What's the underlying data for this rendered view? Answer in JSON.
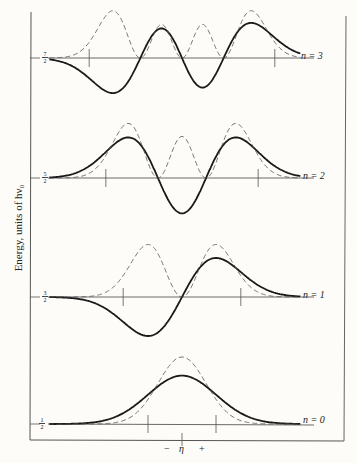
{
  "chart_data": {
    "type": "line",
    "title": "",
    "ylabel": "Energy, units of hν₀",
    "xlabel": "η",
    "x_axis_marks": [
      "−",
      "η",
      "+"
    ],
    "levels": [
      {
        "n": 0,
        "label": "n = 0",
        "energy": "1/2",
        "energy_num": 0.5,
        "turning_points": [
          -1.0,
          1.0
        ],
        "nodes": 0
      },
      {
        "n": 1,
        "label": "n = 1",
        "energy": "3/2",
        "energy_num": 1.5,
        "turning_points": [
          -1.73,
          1.73
        ],
        "nodes": 1
      },
      {
        "n": 2,
        "label": "n = 2",
        "energy": "5/2",
        "energy_num": 2.5,
        "turning_points": [
          -2.24,
          2.24
        ],
        "nodes": 2
      },
      {
        "n": 3,
        "label": "n = 3",
        "energy": "7/2",
        "energy_num": 3.5,
        "turning_points": [
          -2.65,
          2.65
        ],
        "nodes": 3
      }
    ],
    "series": [
      {
        "name": "wavefunction ψ_n",
        "style": "solid"
      },
      {
        "name": "probability density |ψ_n|²",
        "style": "dashed"
      }
    ],
    "grid": false,
    "legend": "none"
  },
  "axis": {
    "ylabel": "Energy, units of hν₀",
    "x_minus": "−",
    "x_eta": "η",
    "x_plus": "+"
  },
  "levels": {
    "n3": {
      "label": "n = 3",
      "num": "7",
      "den": "2"
    },
    "n2": {
      "label": "n = 2",
      "num": "5",
      "den": "2"
    },
    "n1": {
      "label": "n = 1",
      "num": "3",
      "den": "2"
    },
    "n0": {
      "label": "n = 0",
      "num": "1",
      "den": "2"
    }
  }
}
